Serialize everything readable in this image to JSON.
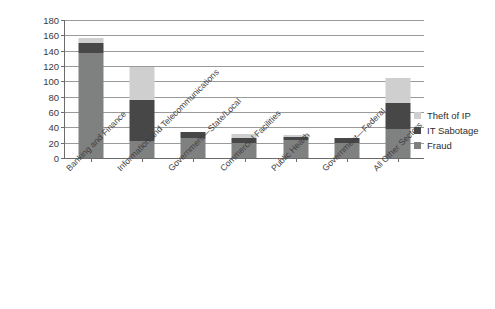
{
  "chart_data": {
    "type": "bar",
    "subtype": "stacked-vertical",
    "title": "",
    "subtitle": "",
    "xlabel": "",
    "ylabel": "",
    "ylim": [
      0,
      180
    ],
    "ytick_step": 20,
    "ytick_labels": [
      "180",
      "160",
      "140",
      "120",
      "100",
      "80",
      "60",
      "40",
      "20",
      "0"
    ],
    "grid": true,
    "grid_orientation": "horizontal",
    "legend_position": "right",
    "categories": [
      "Banking and Finance",
      "Information and Telecommunications",
      "Government—State/Local",
      "Commercial Facilities",
      "Public Health",
      "Government—Federal",
      "All Other Sectors"
    ],
    "series": [
      {
        "name": "Fraud",
        "color": "#7f8080",
        "values": [
          137,
          22,
          26,
          20,
          23,
          20,
          38
        ]
      },
      {
        "name": "IT Sabotage",
        "color": "#474748",
        "values": [
          13,
          54,
          8,
          6,
          5,
          6,
          34
        ]
      },
      {
        "name": "Theft of IP",
        "color": "#cfcfcf",
        "values": [
          6,
          43,
          0,
          5,
          2,
          0,
          32
        ]
      }
    ],
    "stack_order_bottom_to_top": [
      "Fraud",
      "IT Sabotage",
      "Theft of IP"
    ],
    "totals": [
      156,
      119,
      34,
      31,
      30,
      26,
      104
    ],
    "legend_entries": [
      "Theft of IP",
      "IT Sabotage",
      "Fraud"
    ],
    "axis_color": "#6b6b6b",
    "grid_color": "#9a9a9a",
    "background_color": "#ffffff"
  }
}
